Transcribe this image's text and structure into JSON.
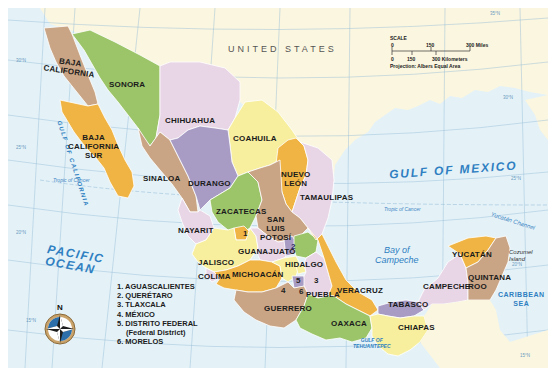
{
  "map": {
    "country_label": "UNITED STATES",
    "scale": {
      "title": "SCALE",
      "miles_ticks": [
        "0",
        "150",
        "300 Miles"
      ],
      "km_ticks": [
        "0",
        "150",
        "300 Kilometers"
      ],
      "projection": "Projection: Albers Equal Area"
    },
    "water_bodies": {
      "pacific_line1": "PACIFIC",
      "pacific_line2": "OCEAN",
      "gulf_of_mexico": "GULF OF MEXICO",
      "gulf_of_california": "GULF OF CALIFORNIA",
      "bay_of_campeche_line1": "Bay of",
      "bay_of_campeche_line2": "Campeche",
      "caribbean_line1": "CARIBBEAN",
      "caribbean_line2": "SEA",
      "yucatan_channel": "Yucatán Channel",
      "cozumel_line1": "Cozumel",
      "cozumel_line2": "Island",
      "tehuantepec_line1": "GULF OF",
      "tehuantepec_line2": "TEHUANTEPEC"
    },
    "grid_labels": {
      "lat_35": "35°N",
      "lat_30_w": "30°N",
      "lat_30_e": "30°N",
      "lat_25_w": "25°N",
      "lat_25_e": "25°N",
      "lat_20_w": "20°N",
      "lat_20_e": "20°N",
      "lat_15_w": "15°N",
      "lat_15_e": "15°N",
      "tropic_w": "Tropic of Cancer",
      "tropic_e": "Tropic of Cancer",
      "lon_115": "115°W",
      "lon_110": "110°W",
      "lon_105": "105°W",
      "lon_100": "100°W",
      "lon_95": "95°W",
      "lon_90": "90°W",
      "lon_85": "85°W"
    },
    "states": {
      "baja_california": [
        "BAJA",
        "CALIFORNIA"
      ],
      "baja_california_sur": [
        "BAJA",
        "CALIFORNIA",
        "SUR"
      ],
      "sonora": "SONORA",
      "chihuahua": "CHIHUAHUA",
      "coahuila": "COAHUILA",
      "nuevo_leon": [
        "NUEVO",
        "LEÓN"
      ],
      "tamaulipas": "TAMAULIPAS",
      "sinaloa": "SINALOA",
      "durango": "DURANGO",
      "zacatecas": "ZACATECAS",
      "san_luis_potosi": [
        "SAN",
        "LUIS",
        "POTOSÍ"
      ],
      "nayarit": "NAYARIT",
      "jalisco": "JALISCO",
      "colima": "COLIMA",
      "guanajuato": "GUANAJUATO",
      "hidalgo": "HIDALGO",
      "michoacan": "MICHOACÁN",
      "guerrero": "GUERRERO",
      "puebla": "PUEBLA",
      "veracruz": "VERACRUZ",
      "oaxaca": "OAXACA",
      "chiapas": "CHIAPAS",
      "tabasco": "TABASCO",
      "campeche": "CAMPECHE",
      "yucatan": "YUCATÁN",
      "quintana_roo": [
        "QUINTANA",
        "ROO"
      ]
    },
    "numbered_markers": [
      "1",
      "2",
      "3",
      "4",
      "5",
      "6"
    ],
    "legend": [
      "1. AGUASCALIENTES",
      "2. QUERÉTARO",
      "3. TLAXCALA",
      "4. MÉXICO",
      "5. DISTRITO FEDERAL",
      "(Federal District)",
      "6. MORELOS"
    ],
    "compass": {
      "north_label": "N"
    },
    "colors": {
      "water": "#e3f1f7",
      "us_land": "#fbf6df",
      "green": "#9cc56a",
      "pink": "#e8d6e6",
      "tan": "#c9a585",
      "orange": "#f0b444",
      "yellow": "#f7ef9e",
      "purple": "#a89cc4",
      "water_text": "#2f7fc1"
    }
  }
}
